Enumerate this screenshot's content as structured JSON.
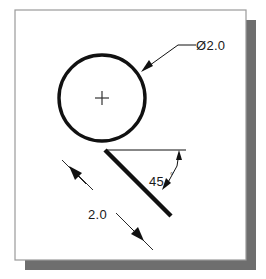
{
  "scene": {
    "background_color": "#ffffff",
    "paper": {
      "fill": "#ffffff",
      "border_color": "#9a9a9a",
      "x": 15,
      "y": 10,
      "width": 231,
      "height": 250
    },
    "shadow": {
      "color": "#6e6e6e",
      "x": 25,
      "y": 20,
      "width": 231,
      "height": 250
    }
  },
  "drawing": {
    "title": "Circle with 45-degree tangent line",
    "line_color": "#111111",
    "circle": {
      "center_x": 102,
      "center_y": 98,
      "radius": 43,
      "stroke_width": 3.4,
      "center_mark": "+"
    },
    "angled_line": {
      "start_x": 105,
      "start_y": 150,
      "end_x": 171,
      "end_y": 216,
      "stroke_width": 4.2,
      "angle_degrees": 45
    },
    "horizontal_reference": {
      "x1": 106,
      "y1": 150,
      "x2": 186,
      "y2": 150,
      "stroke_width": 1
    }
  },
  "annotations": {
    "diameter": {
      "label": "Ø2.0",
      "value": "2.0",
      "symbol": "Ø",
      "text_x": 196,
      "text_y": 48,
      "leader": {
        "arrow_x": 144,
        "arrow_y": 70,
        "elbow_x": 178,
        "elbow_y": 45,
        "shoulder_x": 194,
        "shoulder_y": 45
      }
    },
    "angle": {
      "label": "45",
      "degree_symbol": "°",
      "value": "45°",
      "text_x": 150,
      "text_y": 184,
      "leader": {
        "arrow_x": 163,
        "arrow_y": 188,
        "bend_x": 175,
        "bend_y": 170,
        "top_x": 178,
        "top_y": 152
      }
    },
    "length": {
      "label": "2.0",
      "value": "2.0",
      "text_x": 89,
      "text_y": 217,
      "dim_line": {
        "x1": 71,
        "y1": 168,
        "x2": 142,
        "y2": 239
      },
      "extension_upper": {
        "x1": 62,
        "y1": 160,
        "x2": 84,
        "y2": 182
      },
      "extension_lower": {
        "x1": 131,
        "y1": 228,
        "x2": 152,
        "y2": 249
      }
    }
  },
  "icons": {
    "center_mark": "plus-center-mark-icon",
    "diameter_symbol": "diameter-symbol-icon",
    "degree_symbol": "degree-symbol-icon"
  }
}
